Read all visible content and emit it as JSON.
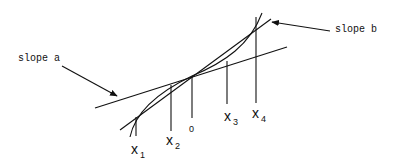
{
  "diagram": {
    "annotations": {
      "slope_a": "slope a",
      "slope_b": "slope b"
    },
    "axis_labels": [
      {
        "base": "x",
        "sub": "1"
      },
      {
        "base": "x",
        "sub": "2"
      },
      {
        "base": "0",
        "sub": ""
      },
      {
        "base": "x",
        "sub": "3"
      },
      {
        "base": "x",
        "sub": "4"
      }
    ],
    "colors": {
      "ink": "#111111",
      "background": "#ffffff"
    }
  }
}
